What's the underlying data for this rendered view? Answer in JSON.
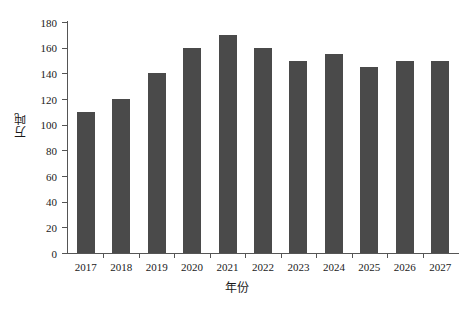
{
  "chart_data": {
    "type": "bar",
    "title": "",
    "subtitle": "",
    "xlabel": "年份",
    "ylabel": "万吨",
    "categories": [
      "2017",
      "2018",
      "2019",
      "2020",
      "2021",
      "2022",
      "2023",
      "2024",
      "2025",
      "2026",
      "2027"
    ],
    "values": [
      110,
      120,
      140,
      160,
      170,
      160,
      150,
      155,
      145,
      150,
      150
    ],
    "series": [
      {
        "name": "万吨",
        "values": [
          110,
          120,
          140,
          160,
          170,
          160,
          150,
          155,
          145,
          150,
          150
        ]
      }
    ],
    "ylim": [
      0,
      180
    ],
    "yticks": [
      0,
      20,
      40,
      60,
      80,
      100,
      120,
      140,
      160,
      180
    ],
    "ytick_labels": [
      "0",
      "20",
      "40",
      "60",
      "80",
      "100",
      "120",
      "140",
      "160",
      "180"
    ],
    "grid": false,
    "legend": "none",
    "bar_color": "#4a4a4a",
    "axis_color": "#555555",
    "background_color": "#ffffff"
  }
}
